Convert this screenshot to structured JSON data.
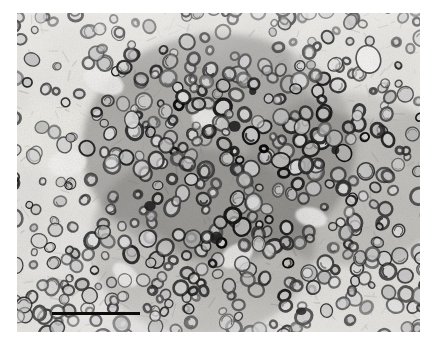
{
  "figure": {
    "type": "micrograph",
    "modality": "transmission-electron-micrograph",
    "color_mode": "grayscale",
    "caption": "",
    "canvas": {
      "width": 436,
      "height": 343
    },
    "background_color": "#ffffff"
  },
  "panel": {
    "x": 17,
    "y": 13,
    "width": 403,
    "height": 319,
    "base_tone": "#e6e4e0",
    "dark_tone": "#1a1a1a",
    "mid_tone": "#7d7b78",
    "light_tone": "#f4f3f1",
    "vignette_opacity": 0.1
  },
  "scale_bar": {
    "label": "",
    "x": 52,
    "y": 312,
    "width": 88,
    "height": 3,
    "color": "#0a0a0a"
  },
  "texture": {
    "seed": 20240613,
    "ring_count": 520,
    "ring_radius_min": 3.2,
    "ring_radius_max": 8.4,
    "ring_stroke_min": 1.0,
    "ring_stroke_max": 2.6,
    "grain_opacity": 0.22,
    "density_regions": [
      {
        "name": "upper-left-light",
        "cx": 0.16,
        "cy": 0.2,
        "r": 0.3,
        "tone": 0.18
      },
      {
        "name": "left-mid-light",
        "cx": 0.1,
        "cy": 0.55,
        "r": 0.26,
        "tone": 0.14
      },
      {
        "name": "center-dark-band",
        "cx": 0.5,
        "cy": 0.42,
        "r": 0.34,
        "tone": -0.26
      },
      {
        "name": "center-lower-dark",
        "cx": 0.46,
        "cy": 0.72,
        "r": 0.28,
        "tone": -0.18
      },
      {
        "name": "right-mid-dark",
        "cx": 0.82,
        "cy": 0.52,
        "r": 0.26,
        "tone": -0.16
      },
      {
        "name": "upper-right-light",
        "cx": 0.88,
        "cy": 0.12,
        "r": 0.2,
        "tone": 0.16
      },
      {
        "name": "lower-left-light",
        "cx": 0.22,
        "cy": 0.88,
        "r": 0.22,
        "tone": 0.12
      }
    ],
    "pale_lacunae": [
      {
        "name": "large-pale-oval-upper-right",
        "cx": 0.872,
        "cy": 0.145,
        "rx": 0.03,
        "ry": 0.044,
        "rot": -18
      },
      {
        "name": "pale-gap-upper-left",
        "cx": 0.215,
        "cy": 0.215,
        "rx": 0.052,
        "ry": 0.038,
        "rot": 22
      },
      {
        "name": "pale-gap-mid-left",
        "cx": 0.125,
        "cy": 0.47,
        "rx": 0.048,
        "ry": 0.04,
        "rot": -10
      },
      {
        "name": "pale-gap-center",
        "cx": 0.47,
        "cy": 0.33,
        "rx": 0.036,
        "ry": 0.03,
        "rot": 5
      },
      {
        "name": "pale-gap-lower-center",
        "cx": 0.545,
        "cy": 0.76,
        "rx": 0.044,
        "ry": 0.034,
        "rot": -30
      },
      {
        "name": "pale-gap-right",
        "cx": 0.73,
        "cy": 0.64,
        "rx": 0.04,
        "ry": 0.03,
        "rot": 14
      },
      {
        "name": "pale-gap-lower-left",
        "cx": 0.27,
        "cy": 0.82,
        "rx": 0.038,
        "ry": 0.028,
        "rot": 40
      }
    ],
    "dense_foci": [
      {
        "name": "dark-focus-center",
        "cx": 0.54,
        "cy": 0.355,
        "r": 0.013
      },
      {
        "name": "dark-focus-left-mid",
        "cx": 0.33,
        "cy": 0.605,
        "r": 0.012
      },
      {
        "name": "dark-focus-lower-center",
        "cx": 0.495,
        "cy": 0.705,
        "r": 0.014
      },
      {
        "name": "dark-focus-scale-bar",
        "cx": 0.705,
        "cy": 0.935,
        "r": 0.011
      },
      {
        "name": "dark-focus-upper-center",
        "cx": 0.585,
        "cy": 0.245,
        "r": 0.01
      },
      {
        "name": "dark-focus-right",
        "cx": 0.79,
        "cy": 0.43,
        "r": 0.011
      }
    ]
  }
}
